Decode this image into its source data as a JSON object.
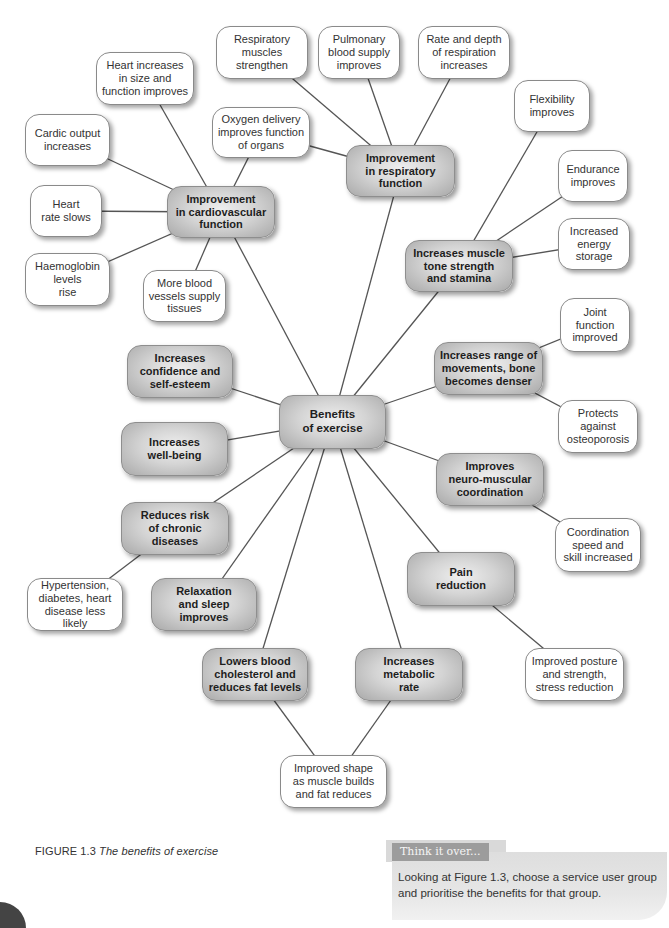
{
  "figure": {
    "number": "FIGURE 1.3",
    "title": "The benefits of exercise"
  },
  "center": {
    "id": "benefits",
    "label": "Benefits\nof exercise",
    "box": [
      279,
      395,
      107,
      54
    ]
  },
  "hubs": [
    {
      "id": "cardio",
      "label": "Improvement\nin cardiovascular\nfunction",
      "box": [
        167,
        186,
        108,
        52
      ]
    },
    {
      "id": "resp",
      "label": "Improvement\nin respiratory\nfunction",
      "box": [
        346,
        145,
        109,
        52
      ]
    },
    {
      "id": "muscle",
      "label": "Increases muscle\ntone strength\nand stamina",
      "box": [
        405,
        240,
        108,
        52
      ]
    },
    {
      "id": "range",
      "label": "Increases range of\nmovements, bone\nbecomes denser",
      "box": [
        434,
        342,
        109,
        53
      ]
    },
    {
      "id": "neuro",
      "label": "Improves\nneuro-muscular\ncoordination",
      "box": [
        436,
        453,
        108,
        53
      ]
    },
    {
      "id": "pain",
      "label": "Pain\nreduction",
      "box": [
        407,
        552,
        108,
        54
      ]
    },
    {
      "id": "metabolic",
      "label": "Increases\nmetabolic\nrate",
      "box": [
        355,
        648,
        108,
        53
      ]
    },
    {
      "id": "cholesterol",
      "label": "Lowers blood\ncholesterol and\nreduces fat levels",
      "box": [
        202,
        648,
        106,
        53
      ]
    },
    {
      "id": "relax",
      "label": "Relaxation\nand sleep\nimproves",
      "box": [
        151,
        578,
        106,
        53
      ]
    },
    {
      "id": "chronic",
      "label": "Reduces risk\nof chronic\ndiseases",
      "box": [
        121,
        502,
        108,
        53
      ]
    },
    {
      "id": "wellbeing",
      "label": "Increases\nwell-being",
      "box": [
        121,
        422,
        107,
        54
      ]
    },
    {
      "id": "confidence",
      "label": "Increases\nconfidence and\nself-esteem",
      "box": [
        127,
        345,
        106,
        53
      ]
    }
  ],
  "leaves": [
    {
      "id": "heart-size",
      "parent": "cardio",
      "label": "Heart increases\nin size and\nfunction improves",
      "box": [
        96,
        52,
        98,
        53
      ]
    },
    {
      "id": "cardic-output",
      "parent": "cardio",
      "label": "Cardic output\nincreases",
      "box": [
        25,
        114,
        85,
        52
      ]
    },
    {
      "id": "heart-rate",
      "parent": "cardio",
      "label": "Heart\nrate slows",
      "box": [
        30,
        185,
        72,
        52
      ]
    },
    {
      "id": "haemoglobin",
      "parent": "cardio",
      "label": "Haemoglobin\nlevels\nrise",
      "box": [
        25,
        253,
        85,
        53
      ]
    },
    {
      "id": "blood-vessels",
      "parent": "cardio",
      "label": "More blood\nvessels supply\ntissues",
      "box": [
        143,
        270,
        83,
        52
      ]
    },
    {
      "id": "oxygen",
      "parent": "cardio",
      "label": "Oxygen delivery\nimproves function\nof organs",
      "box": [
        212,
        107,
        98,
        51
      ]
    },
    {
      "id": "resp-muscles",
      "parent": "resp",
      "label": "Respiratory\nmuscles\nstrengthen",
      "box": [
        216,
        26,
        92,
        53
      ]
    },
    {
      "id": "pulmonary",
      "parent": "resp",
      "label": "Pulmonary\nblood supply\nimproves",
      "box": [
        318,
        26,
        82,
        53
      ]
    },
    {
      "id": "rate-depth",
      "parent": "resp",
      "label": "Rate and depth\nof respiration\nincreases",
      "box": [
        418,
        26,
        92,
        53
      ]
    },
    {
      "id": "flexibility",
      "parent": "muscle",
      "label": "Flexibility\nimproves",
      "box": [
        514,
        80,
        76,
        52
      ]
    },
    {
      "id": "endurance",
      "parent": "muscle",
      "label": "Endurance\nimproves",
      "box": [
        558,
        150,
        70,
        52
      ]
    },
    {
      "id": "energy",
      "parent": "muscle",
      "label": "Increased\nenergy\nstorage",
      "box": [
        558,
        218,
        72,
        52
      ]
    },
    {
      "id": "joint",
      "parent": "range",
      "label": "Joint\nfunction\nimproved",
      "box": [
        560,
        298,
        70,
        54
      ]
    },
    {
      "id": "osteoporosis",
      "parent": "range",
      "label": "Protects\nagainst\nosteoporosis",
      "box": [
        558,
        400,
        80,
        53
      ]
    },
    {
      "id": "coordination",
      "parent": "neuro",
      "label": "Coordination\nspeed and\nskill increased",
      "box": [
        555,
        518,
        86,
        54
      ]
    },
    {
      "id": "posture",
      "parent": "pain",
      "label": "Improved posture\nand strength,\nstress reduction",
      "box": [
        525,
        648,
        99,
        53
      ]
    },
    {
      "id": "shape",
      "parent": "metabolic",
      "label": "Improved shape\nas muscle builds\nand fat reduces",
      "box": [
        280,
        755,
        107,
        53
      ]
    },
    {
      "id": "hypertension",
      "parent": "chronic",
      "label": "Hypertension,\ndiabetes, heart\ndisease less likely",
      "box": [
        27,
        578,
        96,
        53
      ]
    }
  ],
  "extra_links": [
    {
      "from": "cholesterol",
      "to": "shape"
    },
    {
      "from": "oxygen",
      "to": "resp"
    },
    {
      "from": "resp-muscles",
      "to": "resp"
    }
  ],
  "think_it_over": {
    "title": "Think it over...",
    "text": "Looking at Figure 1.3, choose a service user group and prioritise the benefits for that group."
  },
  "colors": {
    "hub_fill": "#c8c8c8",
    "leaf_fill": "#ffffff",
    "line": "#555555",
    "think_title_bg": "#9c9c9c",
    "think_body_bg": "#e2e2e2"
  }
}
